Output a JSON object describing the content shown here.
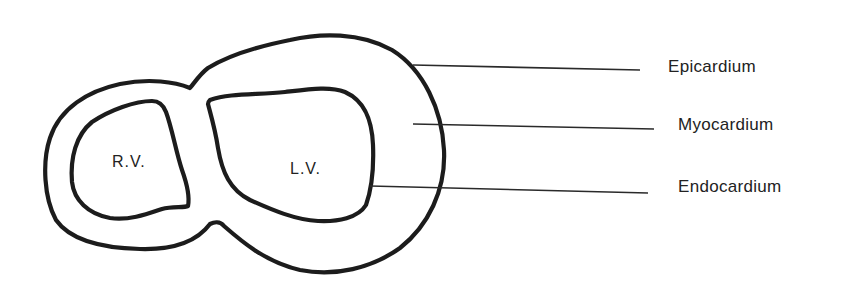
{
  "diagram": {
    "chambers": [
      {
        "id": "rv",
        "label": "R.V."
      },
      {
        "id": "lv",
        "label": "L.V."
      }
    ],
    "layers": [
      {
        "id": "epicardium",
        "label": "Epicardium"
      },
      {
        "id": "myocardium",
        "label": "Myocardium"
      },
      {
        "id": "endocardium",
        "label": "Endocardium"
      }
    ],
    "colors": {
      "stroke": "#1c1c1c",
      "background": "#ffffff",
      "text": "#222222"
    }
  }
}
